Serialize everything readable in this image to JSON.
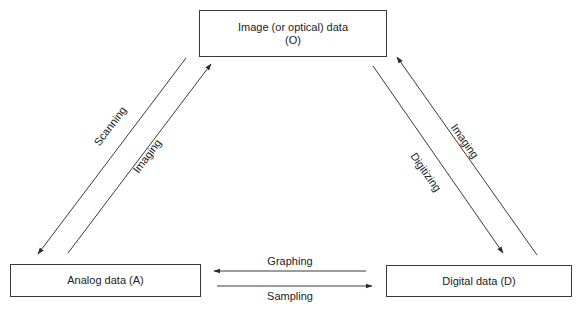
{
  "nodes": {
    "optical": {
      "line1": "Image (or optical) data",
      "line2": "(O)"
    },
    "analog": {
      "label": "Analog data (A)"
    },
    "digital": {
      "label": "Digital data (D)"
    }
  },
  "edges": {
    "scanning": {
      "label": "Scanning",
      "from": "O",
      "to": "A"
    },
    "imaging_a_to_o": {
      "label": "Imaging",
      "from": "A",
      "to": "O"
    },
    "digitizing": {
      "label": "Digitizing",
      "from": "O",
      "to": "D"
    },
    "imaging_d_to_o": {
      "label": "Imaging",
      "from": "D",
      "to": "O"
    },
    "graphing": {
      "label": "Graphing",
      "from": "D",
      "to": "A"
    },
    "sampling": {
      "label": "Sampling",
      "from": "A",
      "to": "D"
    }
  },
  "colors": {
    "stroke": "#3a3a3a",
    "text": "#222222",
    "background": "#ffffff"
  }
}
